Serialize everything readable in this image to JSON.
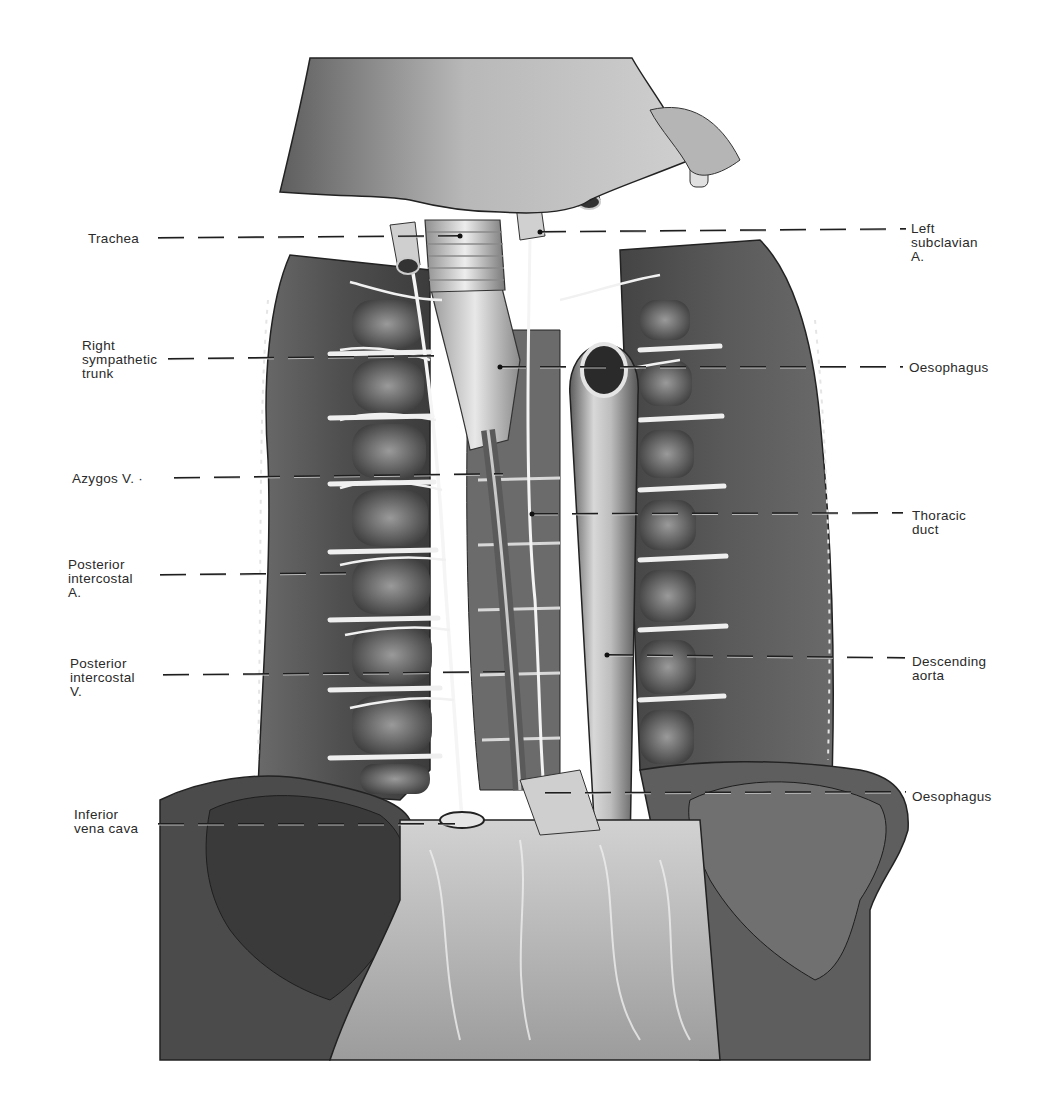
{
  "figure": {
    "background": "#ffffff",
    "ink": "#2a2a2a"
  },
  "labels": {
    "left": [
      {
        "id": "trachea",
        "text": "Trachea",
        "x": 88,
        "y": 232,
        "line": {
          "x1": 158,
          "y1": 238,
          "x2": 460,
          "y2": 236,
          "dot": true
        }
      },
      {
        "id": "right-sympathetic-trunk",
        "text": "Right\nsympathetic\ntrunk",
        "x": 82,
        "y": 339,
        "line": {
          "x1": 168,
          "y1": 359,
          "x2": 440,
          "y2": 356,
          "dot": false
        }
      },
      {
        "id": "azygos-v",
        "text": "Azygos V. ·",
        "x": 72,
        "y": 472,
        "line": {
          "x1": 174,
          "y1": 478,
          "x2": 503,
          "y2": 474,
          "dot": false
        }
      },
      {
        "id": "posterior-intercostal-a",
        "text": "Posterior\nintercostal\nA.",
        "x": 68,
        "y": 558,
        "line": {
          "x1": 160,
          "y1": 575,
          "x2": 350,
          "y2": 573,
          "dot": false
        }
      },
      {
        "id": "posterior-intercostal-v",
        "text": "Posterior\nintercostal\nV.",
        "x": 70,
        "y": 657,
        "line": {
          "x1": 163,
          "y1": 675,
          "x2": 505,
          "y2": 672,
          "dot": false
        }
      },
      {
        "id": "inferior-vena-cava",
        "text": "Inferior\nvena cava",
        "x": 74,
        "y": 808,
        "line": {
          "x1": 158,
          "y1": 824,
          "x2": 455,
          "y2": 824,
          "dot": false
        }
      }
    ],
    "right": [
      {
        "id": "left-subclavian-a",
        "text": "Left\nsubclavian\nA.",
        "x": 911,
        "y": 222,
        "line": {
          "x1": 540,
          "y1": 232,
          "x2": 906,
          "y2": 229,
          "dot": true
        }
      },
      {
        "id": "oesophagus-upper",
        "text": "Oesophagus",
        "x": 909,
        "y": 361,
        "line": {
          "x1": 500,
          "y1": 367,
          "x2": 903,
          "y2": 367,
          "dot": true
        }
      },
      {
        "id": "thoracic-duct",
        "text": "Thoracic\nduct",
        "x": 912,
        "y": 509,
        "line": {
          "x1": 532,
          "y1": 514,
          "x2": 903,
          "y2": 513,
          "dot": true
        }
      },
      {
        "id": "descending-aorta",
        "text": "Descending\naorta",
        "x": 912,
        "y": 655,
        "line": {
          "x1": 607,
          "y1": 655,
          "x2": 905,
          "y2": 658,
          "dot": true
        }
      },
      {
        "id": "oesophagus-lower",
        "text": "Oesophagus",
        "x": 912,
        "y": 790,
        "line": {
          "x1": 545,
          "y1": 793,
          "x2": 906,
          "y2": 792,
          "dot": false
        }
      }
    ]
  }
}
